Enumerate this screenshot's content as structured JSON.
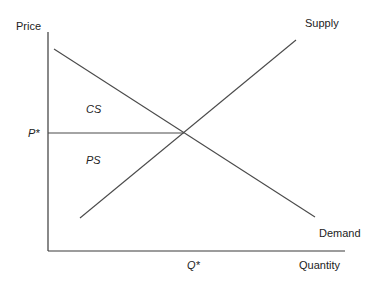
{
  "diagram": {
    "axes": {
      "y_label": "Price",
      "x_label": "Quantity"
    },
    "curves": {
      "supply_label": "Supply",
      "demand_label": "Demand"
    },
    "equilibrium": {
      "price_label": "P*",
      "quantity_label": "Q*"
    },
    "regions": {
      "consumer_surplus": "CS",
      "producer_surplus": "PS"
    },
    "colors": {
      "line": "#4a4a4a",
      "text": "#222222",
      "background": "#ffffff"
    }
  }
}
